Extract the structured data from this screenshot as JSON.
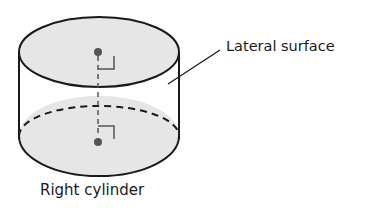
{
  "diagram": {
    "title": "Right cylinder",
    "labels": {
      "lateral_surface": "Lateral surface",
      "caption": "Right cylinder"
    },
    "colors": {
      "base_fill": "#e6e6e6",
      "stroke": "#1a1a1a",
      "center_dot": "#555555",
      "axis": "#555555"
    },
    "elements": [
      "top base (ellipse, shaded)",
      "bottom base (ellipse, shaded, back half dashed)",
      "lateral surface",
      "center points of bases",
      "dashed axis connecting centers",
      "right-angle markers at centers"
    ]
  }
}
